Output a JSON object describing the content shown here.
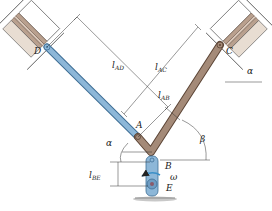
{
  "diagram": {
    "title": "",
    "type": "mechanism",
    "colors": {
      "blue_rod": "#8db7d8",
      "blue_rod_edge": "#3f6f96",
      "brown_link": "#a48a78",
      "brown_link_edge": "#5c4536",
      "piston_band": "#b9a08e",
      "piston_body": "#ffffff",
      "dim_line": "#333333",
      "ground": "#8a8a8a"
    },
    "points": {
      "D": {
        "label": "D"
      },
      "C": {
        "label": "C"
      },
      "A": {
        "label": "A"
      },
      "B": {
        "label": "B"
      },
      "E": {
        "label": "E"
      }
    },
    "dimensions": {
      "l_AD": {
        "main": "l",
        "sub": "AD"
      },
      "l_AC": {
        "main": "l",
        "sub": "AC"
      },
      "l_AB": {
        "main": "l",
        "sub": "AB"
      },
      "l_BE": {
        "main": "l",
        "sub": "BE"
      }
    },
    "angles": {
      "alpha_left": "α",
      "alpha_right": "α",
      "beta": "β"
    },
    "angular_velocity": "ω"
  }
}
